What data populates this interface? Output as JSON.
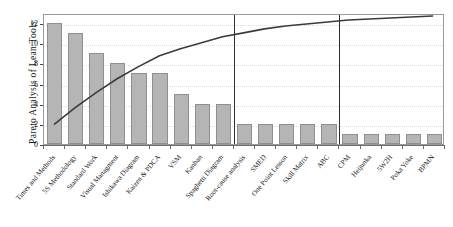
{
  "chart_data": {
    "type": "bar",
    "title": "",
    "ylabel": "Pareto Analysis of Lean Tools",
    "xlabel": "",
    "ylim": [
      0,
      13
    ],
    "yticks": [
      0,
      2,
      4,
      6,
      8,
      10,
      12
    ],
    "ytick_labels": [
      "0",
      "2",
      "4",
      "6",
      "8",
      "10",
      "12"
    ],
    "grid": true,
    "legend": "none",
    "categories": [
      "Times and Methods",
      "5S Methodology",
      "Standard Work",
      "Visual Managment",
      "Ishikawa Diagram",
      "Kaizen & PDCA",
      "VSM",
      "Kanban",
      "Spaghetti Diagram",
      "Root-cause analysis",
      "SMED",
      "One Point Lesson",
      "Skill Matrix",
      "ABC",
      "CPM",
      "Heijunka",
      "5W2H",
      "Poka Yoke",
      "BPMN"
    ],
    "values": [
      12,
      11,
      9,
      8,
      7,
      7,
      5,
      4,
      4,
      2,
      2,
      2,
      2,
      2,
      1,
      1,
      1,
      1,
      1
    ],
    "cumulative_percent": [
      16.0,
      30.7,
      42.7,
      53.3,
      62.7,
      72.0,
      78.7,
      84.0,
      89.3,
      92.0,
      94.7,
      96.0,
      97.3,
      98.0,
      98.7,
      99.0,
      99.3,
      99.7,
      100.0
    ],
    "cumulative_axis_scaled": [
      2.0,
      3.7,
      5.2,
      6.6,
      7.8,
      8.9,
      9.6,
      10.2,
      10.8,
      11.2,
      11.6,
      11.9,
      12.1,
      12.3,
      12.5,
      12.6,
      12.7,
      12.8,
      12.9
    ],
    "dividers_after_category_index": [
      8,
      13
    ],
    "bar_color": "#b5b5b5",
    "bar_edge_color": "#8f8f8f",
    "curve_color": "#3b3b3b",
    "grid_color": "#e8d8d8",
    "divider_color": "#2e2e2e",
    "axis_color": "#9a9a9a"
  }
}
